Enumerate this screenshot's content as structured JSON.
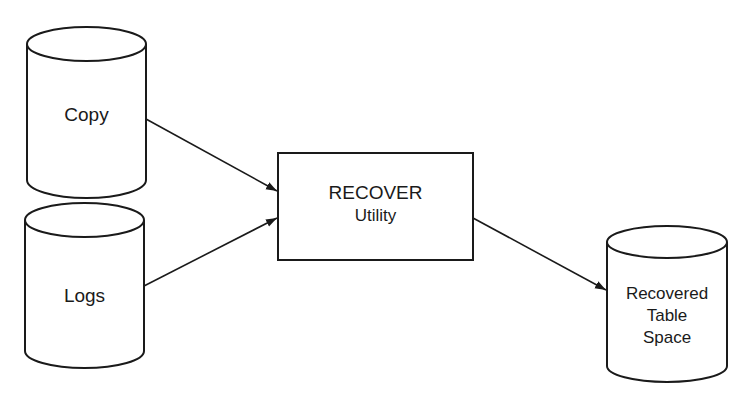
{
  "diagram": {
    "nodes": [
      {
        "id": "copy",
        "type": "cylinder",
        "label": "Copy"
      },
      {
        "id": "logs",
        "type": "cylinder",
        "label": "Logs"
      },
      {
        "id": "recover",
        "type": "box",
        "title": "RECOVER",
        "subtitle": "Utility"
      },
      {
        "id": "recovered",
        "type": "cylinder",
        "lines": [
          "Recovered",
          "Table",
          "Space"
        ]
      }
    ],
    "edges": [
      {
        "from": "copy",
        "to": "recover"
      },
      {
        "from": "logs",
        "to": "recover"
      },
      {
        "from": "recover",
        "to": "recovered"
      }
    ],
    "colors": {
      "stroke": "#1a1a1a",
      "background": "#ffffff"
    }
  }
}
